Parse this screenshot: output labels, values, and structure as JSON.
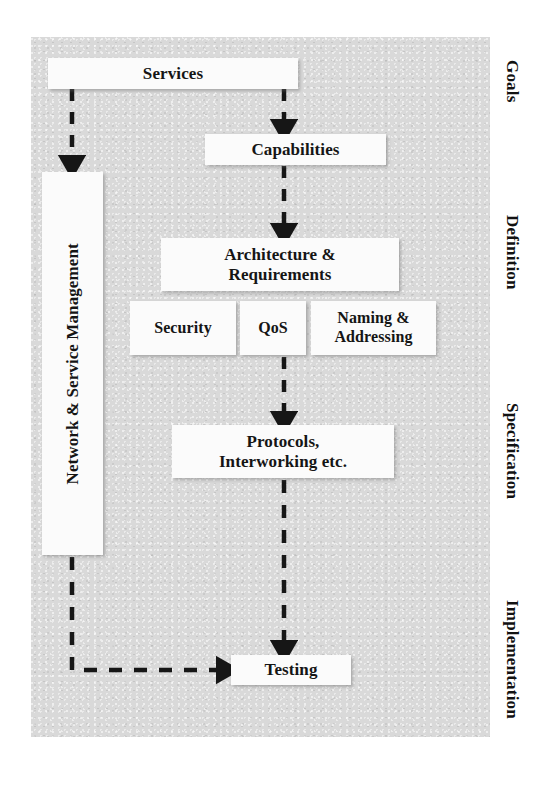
{
  "diagram": {
    "panel_color": "#d9d9d9",
    "box_color": "#fbfbfb",
    "arrow_color": "#161616",
    "arrow_style": "dashed",
    "boxes": {
      "services": "Services",
      "capabilities": "Capabilities",
      "architecture": "Architecture &\nRequirements",
      "architecture_line1": "Architecture &",
      "architecture_line2": "Requirements",
      "security": "Security",
      "qos": "QoS",
      "naming_line1": "Naming &",
      "naming_line2": "Addressing",
      "protocols_line1": "Protocols,",
      "protocols_line2": "Interworking etc.",
      "testing": "Testing",
      "network_service_management": "Network & Service Management"
    },
    "stages": [
      {
        "id": "goals",
        "label": "Goals"
      },
      {
        "id": "definition",
        "label": "Definition"
      },
      {
        "id": "specification",
        "label": "Specification"
      },
      {
        "id": "implementation",
        "label": "Implementation"
      }
    ],
    "connections": [
      {
        "from": "services",
        "to": "network_service_management",
        "style": "dashed",
        "direction": "down"
      },
      {
        "from": "services",
        "to": "capabilities",
        "style": "dashed",
        "direction": "down"
      },
      {
        "from": "capabilities",
        "to": "architecture",
        "style": "dashed",
        "direction": "down"
      },
      {
        "from": "architecture",
        "to": "protocols",
        "style": "dashed",
        "direction": "down"
      },
      {
        "from": "protocols",
        "to": "testing",
        "style": "dashed",
        "direction": "down"
      },
      {
        "from": "network_service_management",
        "to": "testing",
        "style": "dashed",
        "direction": "down-then-right"
      }
    ]
  }
}
